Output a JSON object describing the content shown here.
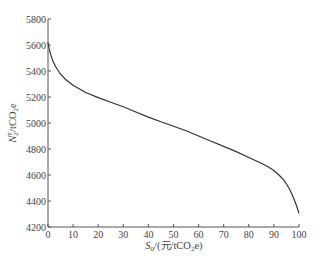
{
  "chart_data": {
    "type": "line",
    "title": "",
    "xlabel": "S0/(元/tCO2e)",
    "ylabel": "N2T/tCO2e",
    "xlabel_parts": {
      "main": "S",
      "sub": "0",
      "rest": "/(元/tCO",
      "sub2": "2",
      "end": "e)"
    },
    "ylabel_parts": {
      "main": "N",
      "sub": "2",
      "sup": "T",
      "rest": "/tCO",
      "sub2": "2",
      "end": "e"
    },
    "xlim": [
      0,
      100
    ],
    "ylim": [
      4200,
      5800
    ],
    "xticks": [
      0,
      10,
      20,
      30,
      40,
      50,
      60,
      70,
      80,
      90,
      100
    ],
    "yticks": [
      4200,
      4400,
      4600,
      4800,
      5000,
      5200,
      5400,
      5600,
      5800
    ],
    "grid": false,
    "legend": null,
    "series": [
      {
        "name": "N2T",
        "color": "#333333",
        "x": [
          0,
          0.5,
          1,
          2,
          3,
          5,
          7,
          10,
          15,
          20,
          25,
          30,
          35,
          40,
          45,
          50,
          55,
          60,
          65,
          70,
          75,
          80,
          85,
          88,
          90,
          92,
          94,
          96,
          97,
          98,
          99,
          100
        ],
        "y": [
          5620,
          5570,
          5530,
          5475,
          5435,
          5375,
          5335,
          5290,
          5235,
          5195,
          5160,
          5125,
          5085,
          5045,
          5010,
          4975,
          4940,
          4900,
          4860,
          4820,
          4780,
          4735,
          4690,
          4660,
          4635,
          4600,
          4560,
          4500,
          4460,
          4415,
          4365,
          4305
        ]
      }
    ]
  }
}
